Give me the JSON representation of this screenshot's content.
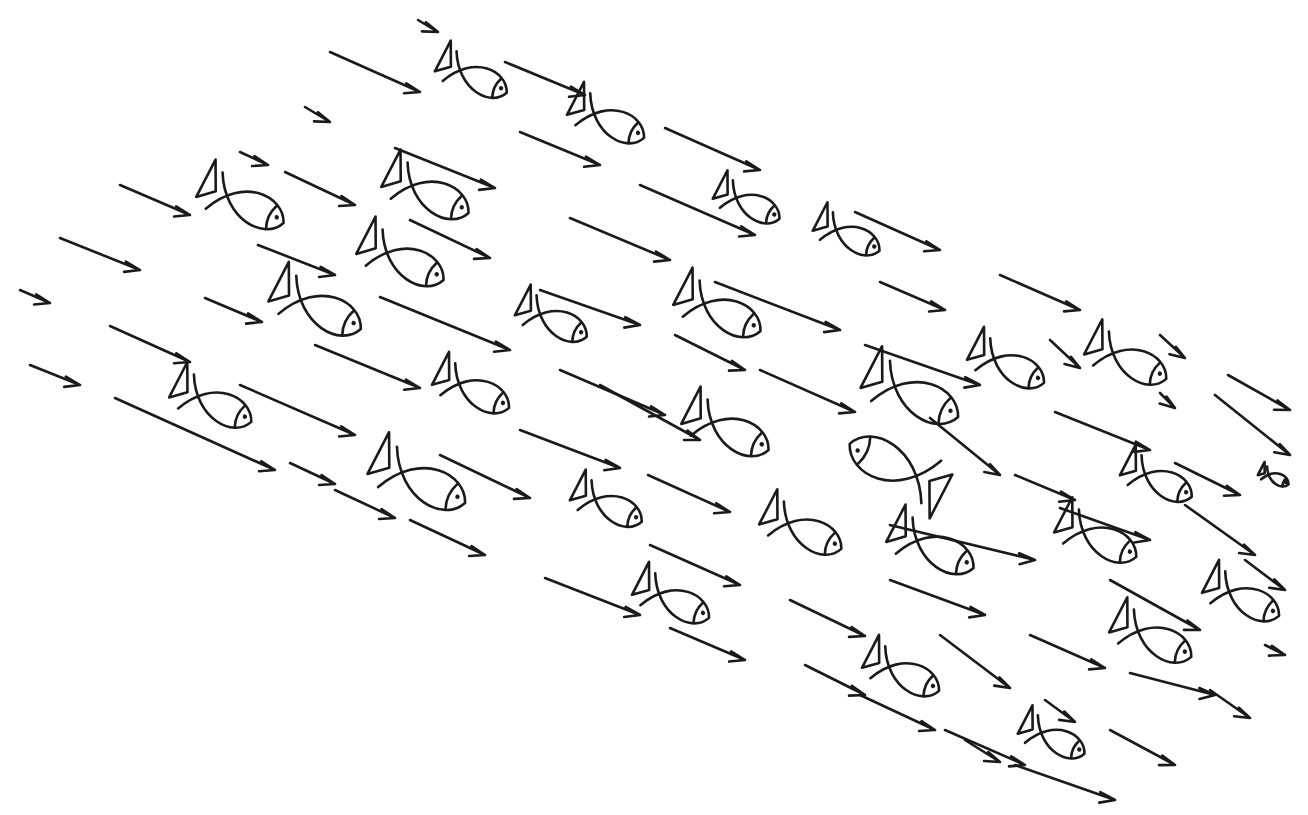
{
  "figure": {
    "ink_color": "#1a1a1a",
    "background": "#ffffff"
  },
  "arrows": [
    [
      418,
      20,
      438,
      32
    ],
    [
      330,
      52,
      420,
      92
    ],
    [
      505,
      62,
      585,
      95
    ],
    [
      305,
      107,
      330,
      122
    ],
    [
      520,
      132,
      600,
      165
    ],
    [
      665,
      128,
      760,
      170
    ],
    [
      240,
      152,
      268,
      165
    ],
    [
      395,
      148,
      495,
      188
    ],
    [
      285,
      172,
      355,
      205
    ],
    [
      120,
      185,
      190,
      215
    ],
    [
      640,
      185,
      755,
      235
    ],
    [
      855,
      212,
      940,
      250
    ],
    [
      570,
      218,
      670,
      260
    ],
    [
      410,
      220,
      490,
      258
    ],
    [
      60,
      238,
      140,
      270
    ],
    [
      258,
      245,
      335,
      275
    ],
    [
      20,
      290,
      50,
      303
    ],
    [
      205,
      298,
      262,
      322
    ],
    [
      380,
      297,
      510,
      350
    ],
    [
      540,
      290,
      640,
      325
    ],
    [
      880,
      282,
      945,
      310
    ],
    [
      1000,
      275,
      1080,
      310
    ],
    [
      715,
      282,
      840,
      330
    ],
    [
      110,
      326,
      190,
      362
    ],
    [
      675,
      335,
      745,
      370
    ],
    [
      315,
      345,
      420,
      388
    ],
    [
      760,
      370,
      855,
      412
    ],
    [
      1050,
      340,
      1080,
      368
    ],
    [
      560,
      370,
      665,
      415
    ],
    [
      1160,
      335,
      1185,
      358
    ],
    [
      1160,
      393,
      1175,
      408
    ],
    [
      30,
      365,
      80,
      385
    ],
    [
      240,
      385,
      355,
      435
    ],
    [
      865,
      345,
      980,
      385
    ],
    [
      600,
      385,
      700,
      440
    ],
    [
      1228,
      375,
      1290,
      410
    ],
    [
      115,
      398,
      275,
      470
    ],
    [
      520,
      430,
      620,
      468
    ],
    [
      1055,
      412,
      1150,
      450
    ],
    [
      1215,
      395,
      1290,
      455
    ],
    [
      930,
      418,
      1000,
      475
    ],
    [
      648,
      475,
      730,
      512
    ],
    [
      290,
      463,
      335,
      484
    ],
    [
      1015,
      475,
      1075,
      500
    ],
    [
      1175,
      463,
      1240,
      495
    ],
    [
      335,
      490,
      395,
      518
    ],
    [
      410,
      520,
      485,
      555
    ],
    [
      440,
      455,
      530,
      498
    ],
    [
      650,
      545,
      740,
      585
    ],
    [
      890,
      525,
      1035,
      560
    ],
    [
      1060,
      508,
      1150,
      540
    ],
    [
      1185,
      505,
      1255,
      555
    ],
    [
      545,
      578,
      640,
      615
    ],
    [
      890,
      580,
      985,
      615
    ],
    [
      1110,
      580,
      1200,
      630
    ],
    [
      1245,
      560,
      1285,
      590
    ],
    [
      1265,
      645,
      1285,
      655
    ],
    [
      670,
      628,
      745,
      660
    ],
    [
      790,
      600,
      865,
      636
    ],
    [
      940,
      635,
      1010,
      688
    ],
    [
      1030,
      635,
      1105,
      668
    ],
    [
      1130,
      673,
      1215,
      695
    ],
    [
      1210,
      690,
      1250,
      718
    ],
    [
      805,
      665,
      865,
      695
    ],
    [
      860,
      695,
      935,
      730
    ],
    [
      965,
      740,
      1000,
      762
    ],
    [
      1045,
      700,
      1075,
      722
    ],
    [
      1110,
      730,
      1175,
      765
    ],
    [
      945,
      730,
      1025,
      765
    ],
    [
      1015,
      765,
      1115,
      800
    ]
  ],
  "fish": [
    {
      "x": 475,
      "y": 78,
      "len": 70,
      "dir": "right"
    },
    {
      "x": 610,
      "y": 122,
      "len": 75,
      "dir": "right"
    },
    {
      "x": 245,
      "y": 205,
      "len": 85,
      "dir": "right"
    },
    {
      "x": 430,
      "y": 195,
      "len": 85,
      "dir": "right"
    },
    {
      "x": 750,
      "y": 205,
      "len": 65,
      "dir": "right"
    },
    {
      "x": 850,
      "y": 237,
      "len": 65,
      "dir": "right"
    },
    {
      "x": 405,
      "y": 262,
      "len": 85,
      "dir": "right"
    },
    {
      "x": 320,
      "y": 310,
      "len": 90,
      "dir": "right"
    },
    {
      "x": 555,
      "y": 322,
      "len": 70,
      "dir": "right"
    },
    {
      "x": 722,
      "y": 313,
      "len": 85,
      "dir": "right"
    },
    {
      "x": 1010,
      "y": 367,
      "len": 75,
      "dir": "right"
    },
    {
      "x": 1130,
      "y": 362,
      "len": 80,
      "dir": "right"
    },
    {
      "x": 475,
      "y": 392,
      "len": 75,
      "dir": "right"
    },
    {
      "x": 215,
      "y": 405,
      "len": 80,
      "dir": "right"
    },
    {
      "x": 915,
      "y": 397,
      "len": 95,
      "dir": "right"
    },
    {
      "x": 730,
      "y": 432,
      "len": 85,
      "dir": "right"
    },
    {
      "x": 895,
      "y": 465,
      "len": 100,
      "dir": "left"
    },
    {
      "x": 422,
      "y": 483,
      "len": 95,
      "dir": "right"
    },
    {
      "x": 1160,
      "y": 482,
      "len": 70,
      "dir": "right"
    },
    {
      "x": 610,
      "y": 507,
      "len": 70,
      "dir": "right"
    },
    {
      "x": 805,
      "y": 532,
      "len": 80,
      "dir": "right"
    },
    {
      "x": 935,
      "y": 550,
      "len": 85,
      "dir": "right"
    },
    {
      "x": 1100,
      "y": 540,
      "len": 80,
      "dir": "right"
    },
    {
      "x": 1275,
      "y": 478,
      "len": 30,
      "dir": "right"
    },
    {
      "x": 675,
      "y": 602,
      "len": 75,
      "dir": "right"
    },
    {
      "x": 1245,
      "y": 600,
      "len": 75,
      "dir": "right"
    },
    {
      "x": 1155,
      "y": 640,
      "len": 80,
      "dir": "right"
    },
    {
      "x": 905,
      "y": 675,
      "len": 75,
      "dir": "right"
    },
    {
      "x": 1055,
      "y": 740,
      "len": 65,
      "dir": "right"
    }
  ]
}
